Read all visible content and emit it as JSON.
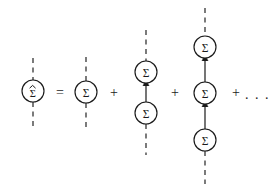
{
  "figure": {
    "kind": "feynman-diagram",
    "background_color": "#ffffff",
    "ink_color": "#1a1a1a",
    "width": 274,
    "height": 192
  },
  "glyphs": {
    "sigma": "Σ",
    "sigma_hatted": "Σ",
    "hat_accent": "^",
    "equals": "=",
    "plus": "+",
    "ellipsis": ". . ."
  },
  "terms": [
    {
      "id": "full-self-energy",
      "role": "left-hand-side",
      "label": "full self-energy",
      "blob_count": 1,
      "blobs": [
        {
          "name": "sigma-hat-blob",
          "symbol": "Σ",
          "accent": "hat",
          "cx": 33,
          "cy": 91,
          "r": 11
        }
      ],
      "dashed_legs": [
        {
          "x": 33,
          "y1": 58,
          "y2": 80
        },
        {
          "x": 33,
          "y1": 102,
          "y2": 126
        }
      ],
      "internal_propagators": []
    },
    {
      "id": "first-order",
      "role": "right-hand-side-term-1",
      "label": "first order",
      "blob_count": 1,
      "blobs": [
        {
          "name": "sigma-blob",
          "symbol": "Σ",
          "accent": "none",
          "cx": 86,
          "cy": 92,
          "r": 11
        }
      ],
      "dashed_legs": [
        {
          "x": 86,
          "y1": 57,
          "y2": 81
        },
        {
          "x": 86,
          "y1": 103,
          "y2": 127
        }
      ],
      "internal_propagators": []
    },
    {
      "id": "second-order",
      "role": "right-hand-side-term-2",
      "label": "second order",
      "blob_count": 2,
      "blobs": [
        {
          "name": "sigma-blob",
          "symbol": "Σ",
          "accent": "none",
          "cx": 146,
          "cy": 72,
          "r": 11
        },
        {
          "name": "sigma-blob",
          "symbol": "Σ",
          "accent": "none",
          "cx": 146,
          "cy": 113,
          "r": 11
        }
      ],
      "dashed_legs": [
        {
          "x": 146,
          "y1": 30,
          "y2": 61
        },
        {
          "x": 146,
          "y1": 124,
          "y2": 155
        }
      ],
      "internal_propagators": [
        {
          "x": 146,
          "y_from": 102,
          "y_to": 83,
          "direction": "up"
        }
      ]
    },
    {
      "id": "third-order",
      "role": "right-hand-side-term-3",
      "label": "third order",
      "blob_count": 3,
      "blobs": [
        {
          "name": "sigma-blob",
          "symbol": "Σ",
          "accent": "none",
          "cx": 205,
          "cy": 47,
          "r": 11
        },
        {
          "name": "sigma-blob",
          "symbol": "Σ",
          "accent": "none",
          "cx": 205,
          "cy": 93,
          "r": 11
        },
        {
          "name": "sigma-blob",
          "symbol": "Σ",
          "accent": "none",
          "cx": 205,
          "cy": 140,
          "r": 11
        }
      ],
      "dashed_legs": [
        {
          "x": 205,
          "y1": 8,
          "y2": 36
        },
        {
          "x": 205,
          "y1": 151,
          "y2": 184
        }
      ],
      "internal_propagators": [
        {
          "x": 205,
          "y_from": 82,
          "y_to": 58,
          "direction": "up"
        },
        {
          "x": 205,
          "y_from": 129,
          "y_to": 104,
          "direction": "up"
        }
      ]
    }
  ],
  "operators": [
    {
      "id": "equals-sign",
      "symbol": "=",
      "x": 60,
      "y": 92
    },
    {
      "id": "plus-sign-1",
      "symbol": "+",
      "x": 114,
      "y": 92
    },
    {
      "id": "plus-sign-2",
      "symbol": "+",
      "x": 175,
      "y": 92
    },
    {
      "id": "plus-sign-3",
      "symbol": "+",
      "x": 236,
      "y": 92
    }
  ],
  "ellipsis": {
    "id": "series-ellipsis",
    "symbol": ". . .",
    "x": 246,
    "y": 93
  }
}
